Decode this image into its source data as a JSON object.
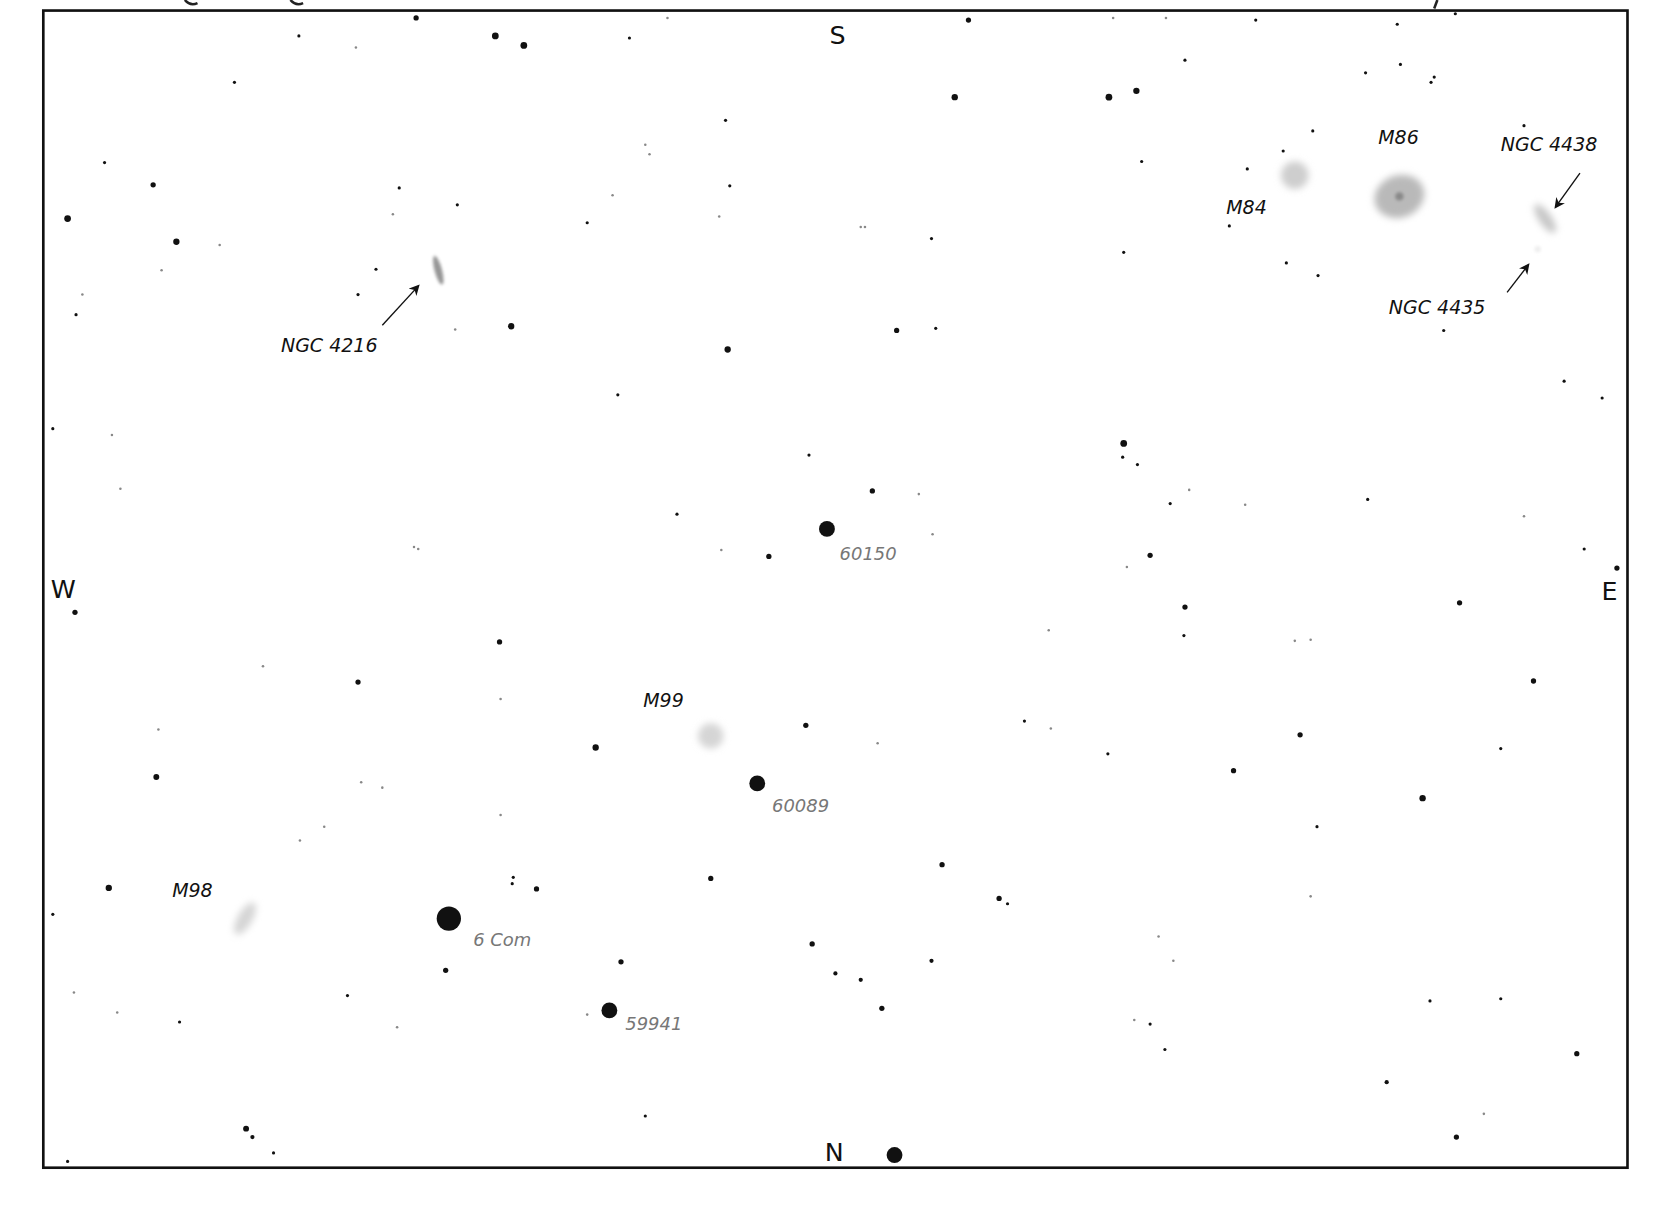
{
  "chart": {
    "title_partial": "galaxies (partially cut off at top edge)",
    "frame_color": "#111111",
    "background": "#ffffff",
    "directions": [
      {
        "label": "S",
        "x": 793,
        "y": 42
      },
      {
        "label": "N",
        "x": 790,
        "y": 1100
      },
      {
        "label": "W",
        "x": 60,
        "y": 566
      },
      {
        "label": "E",
        "x": 1524,
        "y": 568
      }
    ],
    "galaxies": [
      {
        "name": "M84",
        "label": "M84",
        "cx": 1226,
        "cy": 166,
        "rx": 13,
        "ry": 13,
        "rot": 0,
        "shade": 0.35,
        "lx": 1161,
        "ly": 203
      },
      {
        "name": "M86",
        "label": "M86",
        "cx": 1325,
        "cy": 186,
        "rx": 24,
        "ry": 20,
        "rot": -20,
        "shade": 0.5,
        "lx": 1305,
        "ly": 136
      },
      {
        "name": "NGC 4438",
        "label": "NGC 4438",
        "cx": 1463,
        "cy": 207,
        "rx": 6,
        "ry": 16,
        "rot": -35,
        "shade": 0.4,
        "lx": 1421,
        "ly": 143
      },
      {
        "name": "NGC 4435",
        "label": "NGC 4435",
        "cx": 1456,
        "cy": 236,
        "rx": 3,
        "ry": 3,
        "rot": 0,
        "shade": 0.12,
        "lx": 1315,
        "ly": 297
      },
      {
        "name": "NGC 4216",
        "label": "NGC 4216",
        "cx": 415,
        "cy": 256,
        "rx": 3.5,
        "ry": 14,
        "rot": -15,
        "shade": 0.75,
        "lx": 266,
        "ly": 333
      },
      {
        "name": "M99",
        "label": "M99",
        "cx": 673,
        "cy": 697,
        "rx": 12,
        "ry": 12,
        "rot": 0,
        "shade": 0.3,
        "lx": 609,
        "ly": 670
      },
      {
        "name": "M98",
        "label": "M98",
        "cx": 232,
        "cy": 870,
        "rx": 7,
        "ry": 17,
        "rot": 30,
        "shade": 0.3,
        "lx": 163,
        "ly": 850
      }
    ],
    "arrows": [
      {
        "for": "NGC 4216",
        "x1": 362,
        "y1": 308,
        "x2": 396,
        "y2": 271
      },
      {
        "for": "NGC 4438",
        "x1": 1496,
        "y1": 164,
        "x2": 1473,
        "y2": 196
      },
      {
        "for": "NGC 4435",
        "x1": 1427,
        "y1": 277,
        "x2": 1447,
        "y2": 251
      }
    ],
    "labeled_stars": [
      {
        "label": "60150",
        "cx": 783,
        "cy": 501,
        "r": 7.5,
        "lx": 795,
        "ly": 530
      },
      {
        "label": "60089",
        "cx": 717,
        "cy": 742,
        "r": 7.5,
        "lx": 731,
        "ly": 769
      },
      {
        "label": "6 Com",
        "cx": 425,
        "cy": 870,
        "r": 11.5,
        "lx": 448,
        "ly": 896
      },
      {
        "label": "59941",
        "cx": 577,
        "cy": 957,
        "r": 7.5,
        "lx": 592,
        "ly": 976
      }
    ],
    "stars": [
      [
        394,
        17,
        2.5
      ],
      [
        469,
        34,
        3.2
      ],
      [
        496,
        43,
        3.2
      ],
      [
        283,
        34,
        1.5
      ],
      [
        337,
        45,
        1.2
      ],
      [
        596,
        36,
        1.5
      ],
      [
        632,
        17,
        1.2
      ],
      [
        917,
        19,
        2.5
      ],
      [
        1054,
        17,
        1.2
      ],
      [
        1104,
        17,
        1.2
      ],
      [
        1189,
        19,
        1.5
      ],
      [
        1323,
        23,
        1.5
      ],
      [
        1378,
        13,
        1.5
      ],
      [
        222,
        78,
        1.5
      ],
      [
        904,
        92,
        3
      ],
      [
        1050,
        92,
        3.2
      ],
      [
        1076,
        86,
        3
      ],
      [
        1122,
        57,
        1.5
      ],
      [
        1293,
        69,
        1.5
      ],
      [
        1326,
        61,
        1.5
      ],
      [
        1355,
        78,
        1.5
      ],
      [
        1358,
        73,
        1.5
      ],
      [
        99,
        154,
        1.5
      ],
      [
        145,
        175,
        2.5
      ],
      [
        64,
        207,
        3.2
      ],
      [
        167,
        229,
        3
      ],
      [
        208,
        232,
        1.2
      ],
      [
        153,
        256,
        1.2
      ],
      [
        78,
        279,
        1.2
      ],
      [
        72,
        298,
        1.5
      ],
      [
        378,
        178,
        1.5
      ],
      [
        433,
        194,
        1.5
      ],
      [
        372,
        203,
        1.2
      ],
      [
        356,
        255,
        1.5
      ],
      [
        339,
        279,
        1.5
      ],
      [
        484,
        309,
        3
      ],
      [
        431,
        312,
        1.2
      ],
      [
        556,
        211,
        1.5
      ],
      [
        580,
        185,
        1.2
      ],
      [
        615,
        146,
        1.2
      ],
      [
        611,
        137,
        1.2
      ],
      [
        691,
        176,
        1.5
      ],
      [
        681,
        205,
        1.2
      ],
      [
        687,
        114,
        1.5
      ],
      [
        815,
        215,
        1.2
      ],
      [
        819,
        215,
        1.2
      ],
      [
        882,
        226,
        1.5
      ],
      [
        886,
        311,
        1.5
      ],
      [
        849,
        313,
        2.5
      ],
      [
        689,
        331,
        3
      ],
      [
        1064,
        239,
        1.5
      ],
      [
        1081,
        153,
        1.5
      ],
      [
        1164,
        214,
        1.5
      ],
      [
        1181,
        160,
        1.5
      ],
      [
        1215,
        143,
        1.5
      ],
      [
        1243,
        124,
        1.5
      ],
      [
        1218,
        249,
        1.5
      ],
      [
        1248,
        261,
        1.5
      ],
      [
        1443,
        119,
        1.5
      ],
      [
        1367,
        313,
        1.5
      ],
      [
        50,
        406,
        1.5
      ],
      [
        106,
        412,
        1.2
      ],
      [
        114,
        463,
        1.2
      ],
      [
        585,
        374,
        1.5
      ],
      [
        766,
        431,
        1.5
      ],
      [
        826,
        465,
        2.5
      ],
      [
        870,
        468,
        1.2
      ],
      [
        883,
        506,
        1.2
      ],
      [
        728,
        527,
        2.5
      ],
      [
        683,
        521,
        1.2
      ],
      [
        641,
        487,
        1.5
      ],
      [
        392,
        518,
        1.2
      ],
      [
        396,
        520,
        1.2
      ],
      [
        1064,
        420,
        3.2
      ],
      [
        1063,
        433,
        1.5
      ],
      [
        1077,
        440,
        1.5
      ],
      [
        1108,
        477,
        1.5
      ],
      [
        1126,
        464,
        1.2
      ],
      [
        1089,
        526,
        2.5
      ],
      [
        1067,
        537,
        1.2
      ],
      [
        1179,
        478,
        1.2
      ],
      [
        1295,
        473,
        1.5
      ],
      [
        1443,
        489,
        1.2
      ],
      [
        1481,
        361,
        1.5
      ],
      [
        1517,
        377,
        1.5
      ],
      [
        1500,
        520,
        1.5
      ],
      [
        1531,
        538,
        2.5
      ],
      [
        71,
        580,
        2.5
      ],
      [
        473,
        608,
        2.5
      ],
      [
        339,
        646,
        2.5
      ],
      [
        474,
        662,
        1.2
      ],
      [
        249,
        631,
        1.2
      ],
      [
        150,
        691,
        1.2
      ],
      [
        148,
        736,
        2.8
      ],
      [
        342,
        741,
        1.2
      ],
      [
        362,
        746,
        1.2
      ],
      [
        564,
        708,
        3
      ],
      [
        763,
        687,
        2.5
      ],
      [
        831,
        704,
        1.2
      ],
      [
        970,
        683,
        1.5
      ],
      [
        995,
        690,
        1.2
      ],
      [
        993,
        597,
        1.2
      ],
      [
        1122,
        575,
        2.5
      ],
      [
        1121,
        602,
        1.5
      ],
      [
        1226,
        607,
        1.2
      ],
      [
        1241,
        606,
        1.2
      ],
      [
        1231,
        696,
        2.5
      ],
      [
        1049,
        714,
        1.5
      ],
      [
        1168,
        730,
        2.5
      ],
      [
        1382,
        571,
        2.5
      ],
      [
        1452,
        645,
        2.5
      ],
      [
        1421,
        709,
        1.5
      ],
      [
        1347,
        756,
        3
      ],
      [
        103,
        841,
        3
      ],
      [
        50,
        866,
        1.5
      ],
      [
        284,
        796,
        1.2
      ],
      [
        307,
        783,
        1.2
      ],
      [
        474,
        772,
        1.2
      ],
      [
        486,
        831,
        1.5
      ],
      [
        485,
        837,
        1.5
      ],
      [
        508,
        842,
        2.5
      ],
      [
        673,
        832,
        2.5
      ],
      [
        892,
        819,
        2.5
      ],
      [
        946,
        851,
        2.5
      ],
      [
        954,
        856,
        1.5
      ],
      [
        769,
        894,
        2.5
      ],
      [
        882,
        910,
        2
      ],
      [
        791,
        922,
        2
      ],
      [
        815,
        928,
        2
      ],
      [
        835,
        955,
        2.5
      ],
      [
        1247,
        783,
        1.5
      ],
      [
        1097,
        887,
        1.2
      ],
      [
        1111,
        910,
        1.2
      ],
      [
        1241,
        849,
        1.2
      ],
      [
        422,
        919,
        2.5
      ],
      [
        588,
        911,
        2.5
      ],
      [
        70,
        940,
        1.2
      ],
      [
        111,
        959,
        1.2
      ],
      [
        170,
        968,
        1.5
      ],
      [
        329,
        943,
        1.5
      ],
      [
        376,
        973,
        1.2
      ],
      [
        556,
        961,
        1.2
      ],
      [
        1074,
        966,
        1.2
      ],
      [
        1089,
        970,
        1.5
      ],
      [
        1103,
        994,
        1.5
      ],
      [
        1354,
        948,
        1.5
      ],
      [
        1421,
        946,
        1.5
      ],
      [
        1493,
        998,
        2.5
      ],
      [
        1313,
        1025,
        2
      ],
      [
        1379,
        1077,
        2.5
      ],
      [
        1405,
        1055,
        1.2
      ],
      [
        233,
        1069,
        2.8
      ],
      [
        239,
        1077,
        2
      ],
      [
        259,
        1092,
        1.5
      ],
      [
        611,
        1057,
        1.5
      ],
      [
        64,
        1100,
        1.5
      ],
      [
        847,
        1094,
        7.5
      ]
    ]
  }
}
